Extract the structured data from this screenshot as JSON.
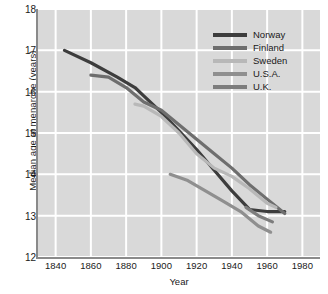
{
  "chart_data": {
    "type": "line",
    "title": "",
    "xlabel": "Year",
    "ylabel": "Median age at menarche (years)",
    "xlim": [
      1830,
      1990
    ],
    "ylim": [
      12,
      18
    ],
    "xticks": [
      "1840",
      "1860",
      "1880",
      "1900",
      "1920",
      "1940",
      "1960",
      "1980"
    ],
    "yticks": [
      "12",
      "13",
      "14",
      "15",
      "16",
      "17",
      "18"
    ],
    "grid": true,
    "legend_position": "top-right",
    "series": [
      {
        "name": "Norway",
        "color": "#3d3d3d",
        "x": [
          1845,
          1860,
          1875,
          1885,
          1890,
          1900,
          1910,
          1920,
          1930,
          1940,
          1950,
          1960,
          1970
        ],
        "values": [
          17.0,
          16.7,
          16.35,
          16.1,
          15.9,
          15.5,
          15.05,
          14.6,
          14.1,
          13.6,
          13.15,
          13.1,
          13.1
        ]
      },
      {
        "name": "Finland",
        "color": "#6e6e6e",
        "x": [
          1860,
          1870,
          1880,
          1890,
          1900,
          1910,
          1920,
          1930,
          1940,
          1950,
          1960,
          1970
        ],
        "values": [
          16.4,
          16.35,
          16.1,
          15.75,
          15.55,
          15.2,
          14.85,
          14.5,
          14.15,
          13.75,
          13.4,
          13.05
        ]
      },
      {
        "name": "Sweden",
        "color": "#b8b8b8",
        "x": [
          1885,
          1890,
          1900,
          1910,
          1920,
          1930,
          1940,
          1950,
          1960,
          1965
        ],
        "values": [
          15.7,
          15.65,
          15.4,
          15.0,
          14.5,
          14.15,
          13.95,
          13.65,
          13.3,
          13.2
        ]
      },
      {
        "name": "U.S.A.",
        "color": "#8f8f8f",
        "x": [
          1905,
          1915,
          1925,
          1935,
          1945,
          1955,
          1962
        ],
        "values": [
          14.0,
          13.85,
          13.6,
          13.35,
          13.1,
          12.75,
          12.6
        ]
      },
      {
        "name": "U.K.",
        "color": "#7d7d7d",
        "x": [
          1948,
          1955,
          1963
        ],
        "values": [
          13.2,
          13.0,
          12.85
        ]
      }
    ]
  },
  "legend": {
    "items": [
      {
        "label": "Norway"
      },
      {
        "label": "Finland"
      },
      {
        "label": "Sweden"
      },
      {
        "label": "U.S.A."
      },
      {
        "label": "U.K."
      }
    ]
  }
}
